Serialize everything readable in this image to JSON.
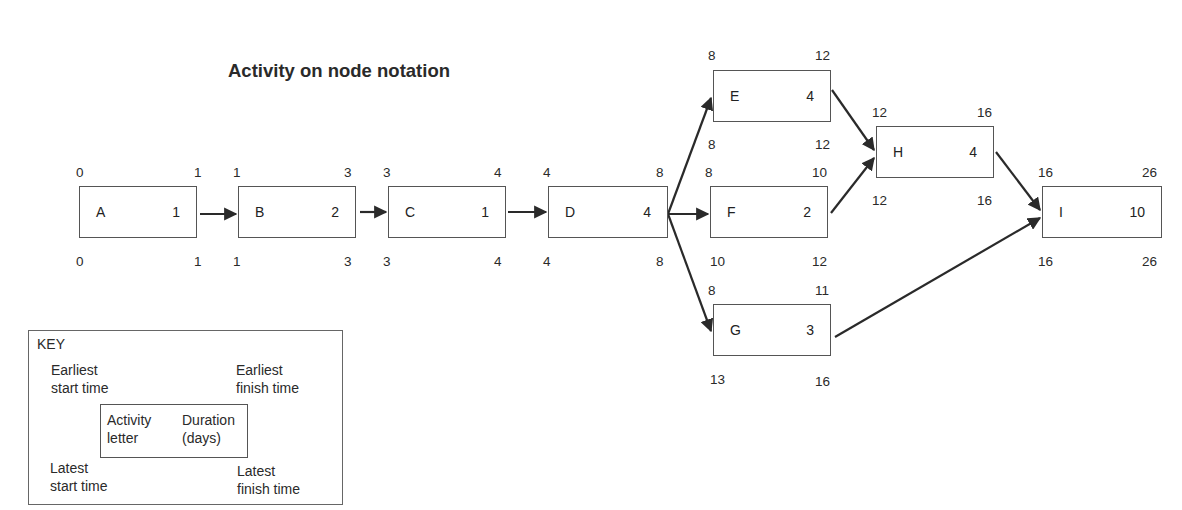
{
  "title": "Activity on node notation",
  "nodes": [
    {
      "id": "A",
      "letter": "A",
      "duration": "1",
      "es": "0",
      "ef": "1",
      "ls": "0",
      "lf": "1"
    },
    {
      "id": "B",
      "letter": "B",
      "duration": "2",
      "es": "1",
      "ef": "3",
      "ls": "1",
      "lf": "3"
    },
    {
      "id": "C",
      "letter": "C",
      "duration": "1",
      "es": "3",
      "ef": "4",
      "ls": "3",
      "lf": "4"
    },
    {
      "id": "D",
      "letter": "D",
      "duration": "4",
      "es": "4",
      "ef": "8",
      "ls": "4",
      "lf": "8"
    },
    {
      "id": "E",
      "letter": "E",
      "duration": "4",
      "es": "8",
      "ef": "12",
      "ls": "8",
      "lf": "12"
    },
    {
      "id": "F",
      "letter": "F",
      "duration": "2",
      "es": "8",
      "ef": "10",
      "ls": "10",
      "lf": "12"
    },
    {
      "id": "G",
      "letter": "G",
      "duration": "3",
      "es": "8",
      "ef": "11",
      "ls": "13",
      "lf": "16"
    },
    {
      "id": "H",
      "letter": "H",
      "duration": "4",
      "es": "12",
      "ef": "16",
      "ls": "12",
      "lf": "16"
    },
    {
      "id": "I",
      "letter": "I",
      "duration": "10",
      "es": "16",
      "ef": "26",
      "ls": "16",
      "lf": "26"
    }
  ],
  "edges": [
    [
      "A",
      "B"
    ],
    [
      "B",
      "C"
    ],
    [
      "C",
      "D"
    ],
    [
      "D",
      "E"
    ],
    [
      "D",
      "F"
    ],
    [
      "D",
      "G"
    ],
    [
      "E",
      "H"
    ],
    [
      "F",
      "H"
    ],
    [
      "H",
      "I"
    ],
    [
      "G",
      "I"
    ]
  ],
  "key": {
    "heading": "KEY",
    "earliest_start": "Earliest\nstart time",
    "earliest_finish": "Earliest\nfinish time",
    "activity_letter": "Activity\nletter",
    "duration": "Duration\n(days)",
    "latest_start": "Latest\nstart time",
    "latest_finish": "Latest\nfinish time"
  },
  "colors": {
    "line": "#2a2a2a",
    "border": "#555555"
  }
}
